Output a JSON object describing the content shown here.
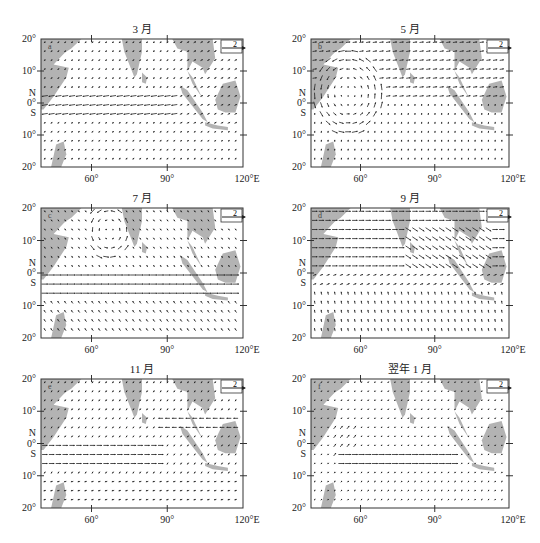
{
  "figure": {
    "type": "vector_wind_maps",
    "reference_vector_label": "2",
    "land_color": "#b3b3b3",
    "arrow_color": "#222222"
  },
  "axes": {
    "y_ticks": [
      "20°",
      "10°",
      "N",
      "0°",
      "S",
      "10°",
      "20°"
    ],
    "x_ticks": [
      "60°",
      "90°",
      "120°E"
    ]
  },
  "panels": [
    {
      "id": "a",
      "title": "3 月",
      "label": "a"
    },
    {
      "id": "b",
      "title": "5 月",
      "label": "b"
    },
    {
      "id": "c",
      "title": "7 月",
      "label": "c"
    },
    {
      "id": "d",
      "title": "9 月",
      "label": "d"
    },
    {
      "id": "e",
      "title": "11 月",
      "label": "e"
    },
    {
      "id": "f",
      "title": "翌年 1 月",
      "label": "f"
    }
  ],
  "chart_data": [
    {
      "type": "vector_field",
      "title": "3 月",
      "panel": "a",
      "xlabel": "Longitude (°E)",
      "ylabel": "Latitude",
      "xlim": [
        40,
        120
      ],
      "ylim": [
        -20,
        20
      ],
      "x_ticks": [
        60,
        90,
        120
      ],
      "y_ticks": [
        -20,
        -10,
        0,
        10,
        20
      ],
      "reference_vector": 2,
      "description": "Weak easterly flow; strong westward currents along ~2°N–4°S; northeastward flow near Southeast Asia"
    },
    {
      "type": "vector_field",
      "title": "5 月",
      "panel": "b",
      "xlabel": "Longitude (°E)",
      "ylabel": "Latitude",
      "xlim": [
        40,
        120
      ],
      "ylim": [
        -20,
        20
      ],
      "x_ticks": [
        60,
        90,
        120
      ],
      "y_ticks": [
        -20,
        -10,
        0,
        10,
        20
      ],
      "reference_vector": 2,
      "description": "Strong anticyclonic gyre near 50–60°E, 0–10°N; eastward flow north of equator; southward/northward flow in south"
    },
    {
      "type": "vector_field",
      "title": "7 月",
      "panel": "c",
      "xlabel": "Longitude (°E)",
      "ylabel": "Latitude",
      "xlim": [
        40,
        120
      ],
      "ylim": [
        -20,
        20
      ],
      "x_ticks": [
        60,
        90,
        120
      ],
      "y_ticks": [
        -20,
        -10,
        0,
        10,
        20
      ],
      "reference_vector": 2,
      "description": "Gyre in Arabian Sea ~60–75°E, 10–18°N; strong zonal jets along 0–8°S extending to 120°E"
    },
    {
      "type": "vector_field",
      "title": "9 月",
      "panel": "d",
      "xlabel": "Longitude (°E)",
      "ylabel": "Latitude",
      "xlim": [
        40,
        120
      ],
      "ylim": [
        -20,
        20
      ],
      "x_ticks": [
        60,
        90,
        120
      ],
      "y_ticks": [
        -20,
        -10,
        0,
        10,
        20
      ],
      "reference_vector": 2,
      "description": "Strong eastward flow north of equator; intense southeastward band from Bay of Bengal toward Sumatra/Java"
    },
    {
      "type": "vector_field",
      "title": "11 月",
      "panel": "e",
      "xlabel": "Longitude (°E)",
      "ylabel": "Latitude",
      "xlim": [
        40,
        120
      ],
      "ylim": [
        -20,
        20
      ],
      "x_ticks": [
        60,
        90,
        120
      ],
      "y_ticks": [
        -20,
        -10,
        0,
        10,
        20
      ],
      "reference_vector": 2,
      "description": "Eastward jets along 0–6°S west of 90°E; westward flow north near 5–8°N around 90–115°E"
    },
    {
      "type": "vector_field",
      "title": "翌年 1 月",
      "panel": "f",
      "xlabel": "Longitude (°E)",
      "ylabel": "Latitude",
      "xlim": [
        40,
        120
      ],
      "ylim": [
        -20,
        20
      ],
      "x_ticks": [
        60,
        90,
        120
      ],
      "y_ticks": [
        -20,
        -10,
        0,
        10,
        20
      ],
      "reference_vector": 2,
      "description": "Mostly weak flow; strong eastward jets along ~4–7°S from 55°E to 100°E; cross-equatorial flow near 50–58°E"
    }
  ]
}
